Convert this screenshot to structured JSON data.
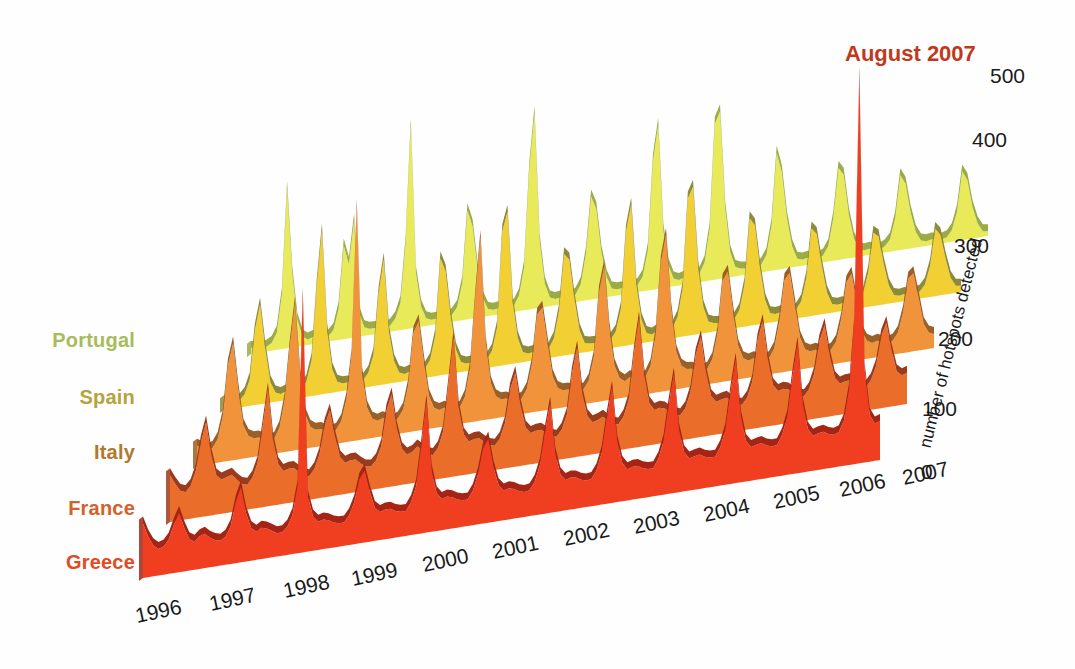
{
  "figure": {
    "background": "#fefefe",
    "annotation": {
      "text": "August 2007",
      "color": "#c0391b",
      "x": 845,
      "y": 41
    }
  },
  "chart_data": {
    "type": "area",
    "title": "",
    "subtitle": "",
    "xlabel": "",
    "ylabel": "number of hotspots detected",
    "ylim": [
      0,
      500
    ],
    "yticks": [
      0,
      100,
      200,
      300,
      400,
      500
    ],
    "grid": false,
    "legend_position": "left-row-labels",
    "style": "3d-ridgeline-joyplot",
    "x_start_year": 1996,
    "x_end_year": 2007,
    "x_tick_labels": [
      "1996",
      "1997",
      "1998",
      "1999",
      "2000",
      "2001",
      "2002",
      "2003",
      "2004",
      "2005",
      "2006",
      "2007"
    ],
    "annotations": [
      {
        "text": "August 2007",
        "series": "Greece",
        "value": 500,
        "note": "record spike"
      }
    ],
    "series": [
      {
        "name": "Portugal",
        "label_color": "#a8bc5a",
        "face_color": "#e9ea5a",
        "ridge_color": "#9aab48",
        "values": [
          8,
          6,
          5,
          6,
          10,
          22,
          70,
          205,
          95,
          34,
          12,
          7,
          9,
          7,
          6,
          7,
          14,
          40,
          120,
          95,
          150,
          30,
          11,
          8,
          8,
          6,
          5,
          8,
          16,
          35,
          110,
          260,
          70,
          26,
          10,
          7,
          7,
          6,
          6,
          9,
          18,
          48,
          140,
          118,
          60,
          24,
          9,
          7,
          8,
          7,
          6,
          8,
          20,
          55,
          180,
          250,
          86,
          30,
          11,
          8,
          9,
          7,
          6,
          10,
          22,
          60,
          132,
          115,
          58,
          26,
          10,
          8,
          8,
          6,
          6,
          9,
          19,
          52,
          165,
          210,
          74,
          28,
          10,
          7,
          9,
          7,
          7,
          11,
          24,
          66,
          200,
          215,
          90,
          32,
          12,
          9,
          8,
          6,
          6,
          10,
          21,
          58,
          150,
          124,
          64,
          27,
          10,
          8,
          9,
          7,
          6,
          9,
          20,
          55,
          118,
          108,
          56,
          24,
          9,
          7,
          8,
          6,
          5,
          8,
          16,
          42,
          96,
          84,
          46,
          20,
          8,
          6,
          7,
          6,
          5,
          7,
          15,
          38,
          88,
          76,
          40,
          18,
          7,
          6
        ]
      },
      {
        "name": "Spain",
        "label_color": "#b5a33c",
        "face_color": "#f2cf33",
        "ridge_color": "#8d8a3a",
        "values": [
          10,
          8,
          7,
          9,
          16,
          34,
          96,
          128,
          70,
          26,
          12,
          9,
          11,
          9,
          8,
          10,
          20,
          46,
          140,
          210,
          82,
          30,
          13,
          10,
          10,
          8,
          7,
          10,
          18,
          40,
          118,
          160,
          66,
          28,
          12,
          9,
          11,
          9,
          8,
          12,
          22,
          52,
          150,
          132,
          72,
          30,
          13,
          10,
          10,
          8,
          8,
          11,
          21,
          50,
          172,
          196,
          80,
          32,
          13,
          10,
          11,
          9,
          8,
          12,
          24,
          58,
          130,
          122,
          70,
          29,
          12,
          10,
          10,
          8,
          7,
          11,
          20,
          48,
          146,
          180,
          76,
          30,
          12,
          9,
          12,
          10,
          9,
          13,
          26,
          62,
          176,
          190,
          86,
          34,
          14,
          11,
          10,
          8,
          8,
          12,
          22,
          54,
          138,
          128,
          72,
          30,
          12,
          10,
          11,
          9,
          8,
          11,
          21,
          50,
          112,
          104,
          62,
          27,
          11,
          9,
          10,
          8,
          7,
          10,
          18,
          44,
          94,
          88,
          52,
          23,
          10,
          8,
          9,
          7,
          7,
          9,
          17,
          40,
          86,
          78,
          46,
          20,
          9,
          8
        ]
      },
      {
        "name": "Italy",
        "label_color": "#b07a2e",
        "face_color": "#f0933a",
        "ridge_color": "#9c5f26",
        "values": [
          26,
          22,
          18,
          20,
          30,
          58,
          122,
          150,
          90,
          42,
          28,
          24,
          24,
          20,
          17,
          19,
          32,
          66,
          134,
          188,
          96,
          44,
          27,
          22,
          22,
          19,
          16,
          18,
          28,
          55,
          110,
          300,
          86,
          40,
          25,
          21,
          23,
          20,
          17,
          20,
          30,
          60,
          126,
          140,
          88,
          42,
          26,
          22,
          24,
          21,
          18,
          21,
          34,
          70,
          160,
          235,
          100,
          46,
          28,
          23,
          23,
          20,
          17,
          20,
          31,
          62,
          124,
          132,
          86,
          42,
          26,
          22,
          22,
          19,
          17,
          19,
          29,
          58,
          140,
          172,
          92,
          43,
          26,
          21,
          25,
          22,
          19,
          22,
          35,
          74,
          166,
          200,
          104,
          48,
          29,
          24,
          23,
          20,
          18,
          20,
          31,
          63,
          130,
          140,
          88,
          43,
          26,
          22,
          24,
          21,
          18,
          21,
          32,
          66,
          118,
          126,
          84,
          41,
          25,
          21,
          22,
          19,
          17,
          19,
          28,
          56,
          102,
          112,
          74,
          36,
          23,
          19,
          21,
          18,
          16,
          18,
          27,
          52,
          94,
          100,
          68,
          33,
          21,
          18
        ]
      },
      {
        "name": "France",
        "label_color": "#d2622c",
        "face_color": "#ea6d2a",
        "ridge_color": "#9c3b1c",
        "values": [
          60,
          48,
          38,
          35,
          42,
          60,
          96,
          120,
          78,
          50,
          44,
          46,
          48,
          40,
          34,
          32,
          40,
          58,
          104,
          150,
          84,
          52,
          42,
          44,
          44,
          38,
          32,
          30,
          38,
          56,
          92,
          110,
          76,
          48,
          40,
          42,
          42,
          36,
          31,
          30,
          37,
          54,
          98,
          118,
          74,
          46,
          38,
          40,
          46,
          40,
          34,
          32,
          40,
          60,
          118,
          178,
          88,
          52,
          42,
          44,
          44,
          38,
          33,
          31,
          39,
          58,
          100,
          120,
          78,
          48,
          40,
          42,
          42,
          37,
          32,
          30,
          38,
          56,
          108,
          140,
          80,
          50,
          41,
          43,
          46,
          40,
          35,
          33,
          42,
          62,
          120,
          165,
          92,
          54,
          44,
          46,
          44,
          38,
          34,
          32,
          40,
          60,
          106,
          128,
          82,
          50,
          42,
          44,
          45,
          39,
          34,
          33,
          41,
          61,
          112,
          136,
          86,
          52,
          43,
          45,
          43,
          37,
          33,
          31,
          39,
          58,
          98,
          118,
          78,
          48,
          40,
          42,
          42,
          36,
          32,
          30,
          38,
          55,
          92,
          108,
          72,
          44,
          38,
          40
        ]
      },
      {
        "name": "Greece",
        "label_color": "#e04b22",
        "face_color": "#f03f20",
        "ridge_color": "#a52414",
        "values": [
          70,
          52,
          40,
          34,
          36,
          44,
          62,
          76,
          56,
          40,
          36,
          42,
          44,
          38,
          34,
          32,
          36,
          48,
          78,
          96,
          62,
          42,
          36,
          40,
          38,
          34,
          30,
          30,
          36,
          50,
          86,
          330,
          70,
          44,
          36,
          38,
          36,
          32,
          30,
          30,
          38,
          54,
          82,
          92,
          64,
          42,
          36,
          38,
          38,
          34,
          32,
          32,
          42,
          62,
          112,
          168,
          78,
          48,
          40,
          42,
          40,
          36,
          34,
          34,
          44,
          64,
          96,
          108,
          70,
          46,
          38,
          40,
          38,
          34,
          32,
          33,
          43,
          63,
          104,
          140,
          74,
          47,
          39,
          41,
          40,
          36,
          34,
          35,
          45,
          66,
          110,
          148,
          78,
          49,
          40,
          42,
          42,
          38,
          36,
          36,
          47,
          68,
          114,
          152,
          80,
          50,
          41,
          43,
          44,
          40,
          38,
          38,
          49,
          70,
          118,
          158,
          84,
          52,
          43,
          45,
          46,
          42,
          40,
          40,
          52,
          74,
          124,
          166,
          88,
          55,
          45,
          47,
          48,
          44,
          42,
          44,
          58,
          96,
          180,
          500,
          120,
          60,
          48,
          50
        ]
      }
    ]
  },
  "axes": {
    "y_title": "number of hotspots detected",
    "y_ticks": [
      {
        "label": "500",
        "x": 990,
        "y": 64
      },
      {
        "label": "400",
        "x": 972,
        "y": 128
      },
      {
        "label": "300",
        "x": 954,
        "y": 234
      },
      {
        "label": "200",
        "x": 938,
        "y": 327
      },
      {
        "label": "100",
        "x": 922,
        "y": 397
      },
      {
        "label": "0",
        "x": 921,
        "y": 460
      }
    ],
    "x_ticks": [
      {
        "label": "1996",
        "x": 138,
        "y": 604
      },
      {
        "label": "1997",
        "x": 212,
        "y": 592
      },
      {
        "label": "1998",
        "x": 286,
        "y": 579
      },
      {
        "label": "1999",
        "x": 354,
        "y": 567
      },
      {
        "label": "2000",
        "x": 425,
        "y": 553
      },
      {
        "label": "2001",
        "x": 495,
        "y": 540
      },
      {
        "label": "2002",
        "x": 566,
        "y": 527
      },
      {
        "label": "2003",
        "x": 636,
        "y": 515
      },
      {
        "label": "2004",
        "x": 706,
        "y": 503
      },
      {
        "label": "2005",
        "x": 776,
        "y": 490
      },
      {
        "label": "2006",
        "x": 842,
        "y": 478
      },
      {
        "label": "2007",
        "x": 905,
        "y": 466
      }
    ]
  },
  "row_labels": [
    {
      "name": "Portugal",
      "color": "#a8bc5a",
      "x": 22,
      "y": 329,
      "width": 113
    },
    {
      "name": "Spain",
      "color": "#b5a33c",
      "x": 55,
      "y": 386,
      "width": 80
    },
    {
      "name": "Italy",
      "color": "#b07a2e",
      "x": 72,
      "y": 441,
      "width": 63
    },
    {
      "name": "France",
      "color": "#d2622c",
      "x": 40,
      "y": 497,
      "width": 95
    },
    {
      "name": "Greece",
      "color": "#e04b22",
      "x": 42,
      "y": 551,
      "width": 93
    }
  ]
}
